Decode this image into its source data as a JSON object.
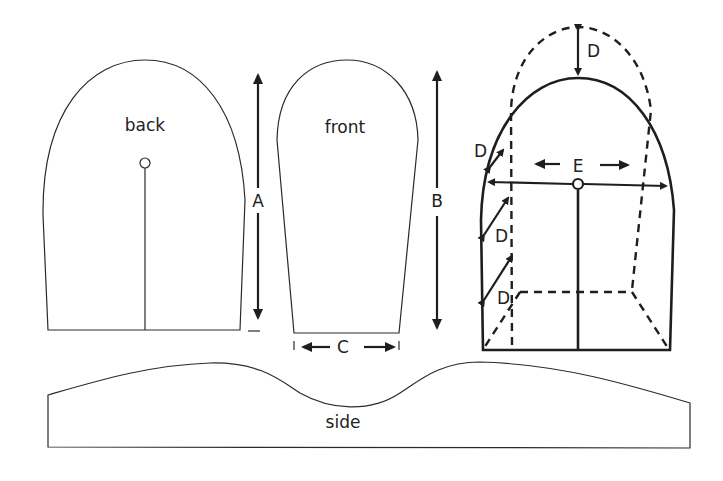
{
  "diagram": {
    "type": "sewing-pattern",
    "pieces": {
      "back": {
        "label": "back"
      },
      "front": {
        "label": "front"
      },
      "side": {
        "label": "side"
      }
    },
    "measurements": {
      "A": "A",
      "B": "B",
      "C": "C",
      "D": "D",
      "E": "E"
    },
    "colors": {
      "line": "#1e1e1e",
      "background": "#ffffff"
    }
  }
}
